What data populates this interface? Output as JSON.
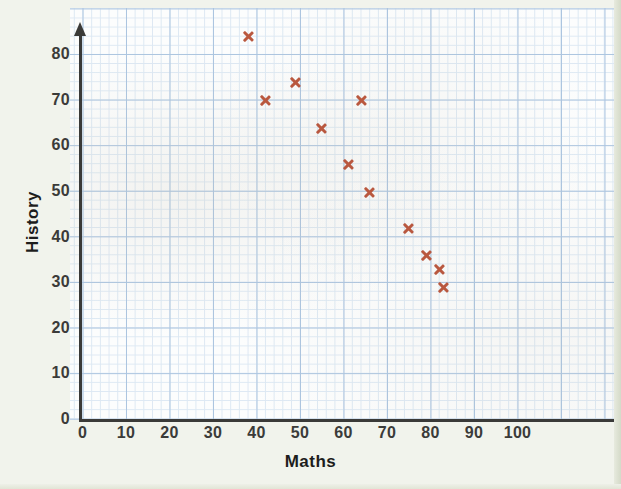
{
  "chart_data": {
    "type": "scatter",
    "title": "",
    "xlabel": "Maths",
    "ylabel": "History",
    "xlim": [
      0,
      110
    ],
    "ylim": [
      0,
      88
    ],
    "xticks": [
      0,
      10,
      20,
      30,
      40,
      50,
      60,
      70,
      80,
      90,
      100
    ],
    "yticks": [
      0,
      10,
      20,
      30,
      40,
      50,
      60,
      70,
      80
    ],
    "grid": true,
    "grid_style": "graph-paper",
    "legend": null,
    "marker": "x",
    "marker_color": "#b9583f",
    "points": [
      {
        "x": 38,
        "y": 84
      },
      {
        "x": 42,
        "y": 70
      },
      {
        "x": 49,
        "y": 74
      },
      {
        "x": 55,
        "y": 64
      },
      {
        "x": 61,
        "y": 56
      },
      {
        "x": 64,
        "y": 70
      },
      {
        "x": 66,
        "y": 50
      },
      {
        "x": 75,
        "y": 42
      },
      {
        "x": 79,
        "y": 36
      },
      {
        "x": 82,
        "y": 33
      },
      {
        "x": 83,
        "y": 29
      }
    ],
    "x_values": [
      38,
      42,
      49,
      55,
      61,
      64,
      66,
      75,
      79,
      82,
      83
    ],
    "y_values": [
      84,
      70,
      74,
      64,
      56,
      70,
      50,
      42,
      36,
      33,
      29
    ]
  },
  "axes": {
    "x_tick_labels": [
      "0",
      "10",
      "20",
      "30",
      "40",
      "50",
      "60",
      "70",
      "80",
      "90",
      "100"
    ],
    "y_tick_labels": [
      "0",
      "10",
      "20",
      "30",
      "40",
      "50",
      "60",
      "70",
      "80"
    ],
    "x_title": "Maths",
    "y_title": "History"
  },
  "colors": {
    "marker": "#b9583f",
    "axis": "#3a3a38",
    "grid_major": "#a9c3e0",
    "grid_minor": "#dce8f4",
    "paper": "#f1f3ec",
    "plot_bg": "#fdfefe"
  }
}
